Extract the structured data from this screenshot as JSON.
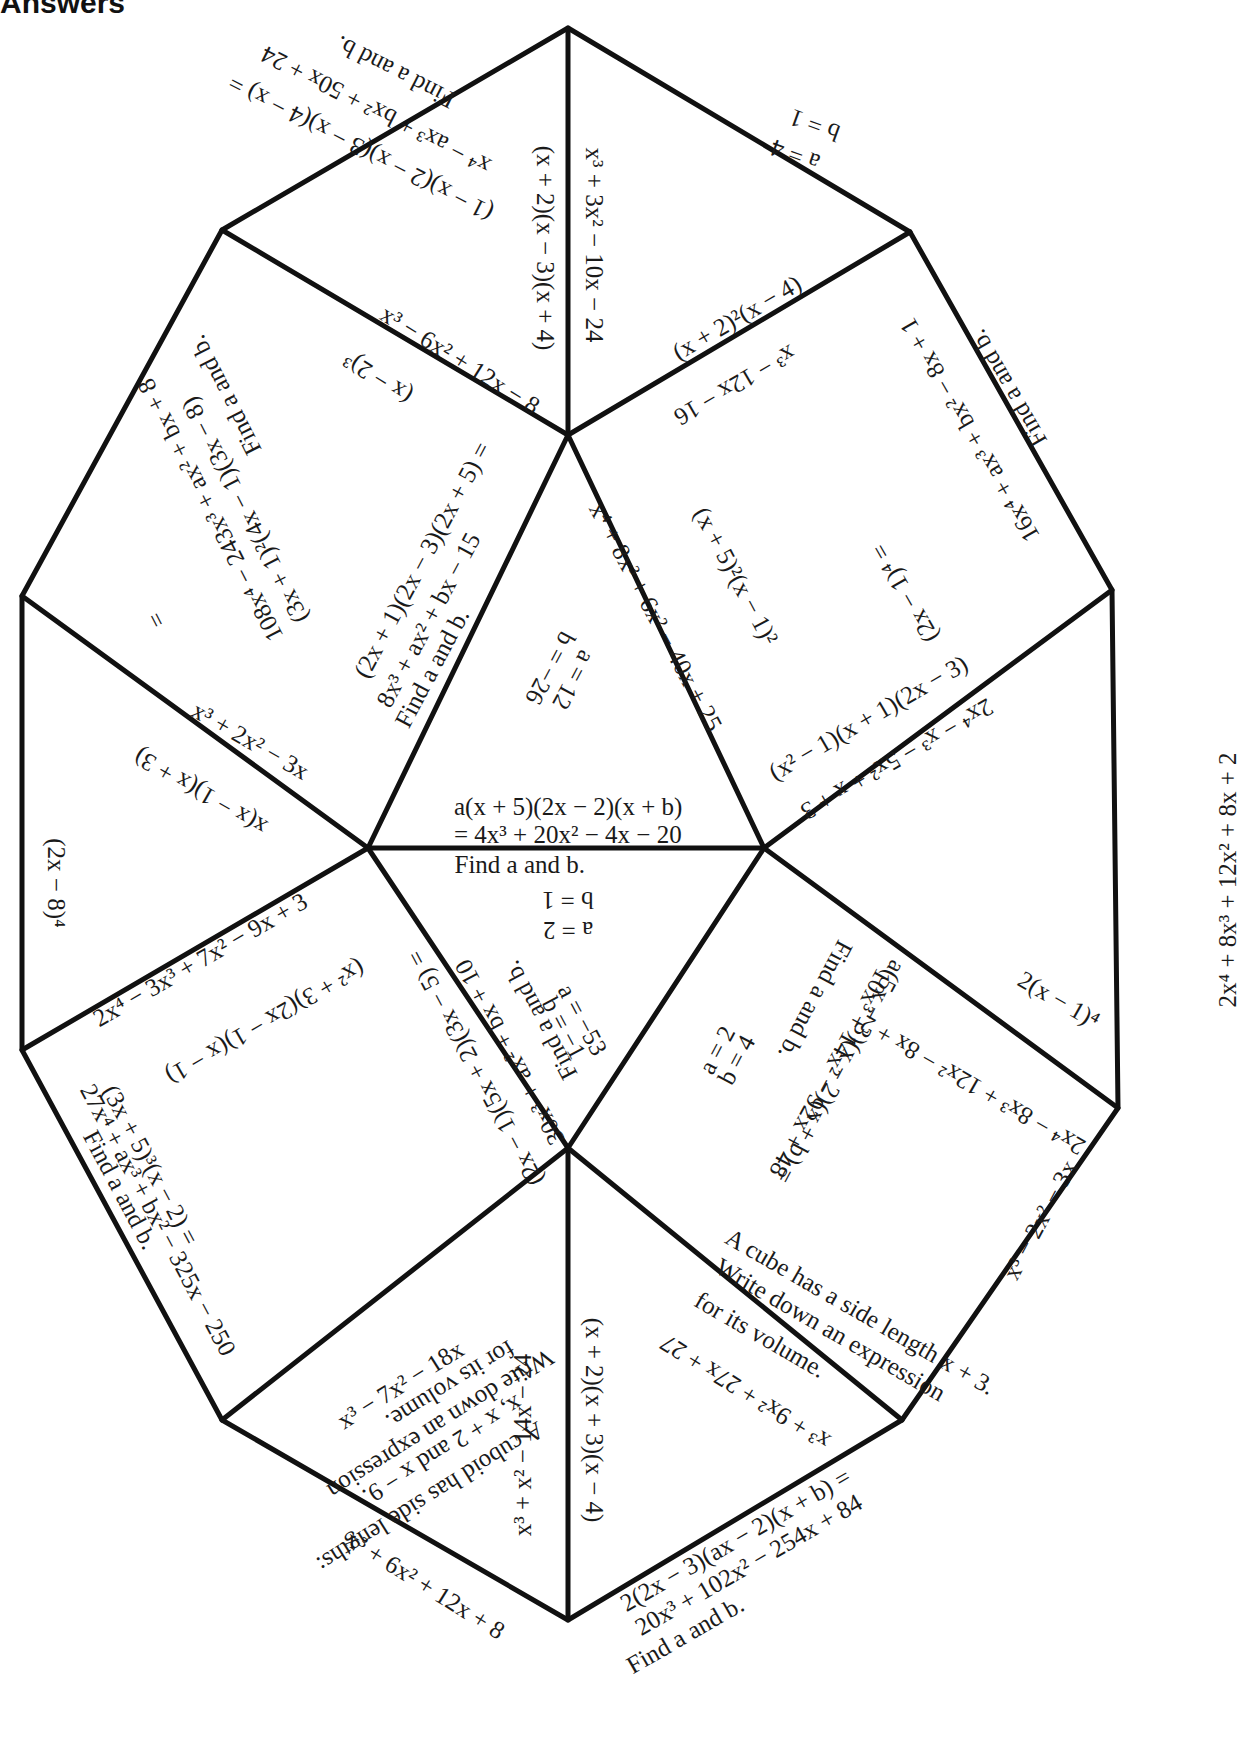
{
  "page": {
    "title": "Answers"
  },
  "colors": {
    "lines": "#111111",
    "text": "#1a1a1a",
    "background": "#ffffff"
  },
  "puzzle": {
    "type": "tarsia-triangle-puzzle",
    "vertices": {
      "top": [
        568,
        28
      ],
      "upper_left": [
        222,
        230
      ],
      "upper_right": [
        910,
        232
      ],
      "mid_left": [
        22,
        596
      ],
      "mid_right": [
        1112,
        590
      ],
      "lower_left": [
        22,
        1050
      ],
      "lower_right": [
        1118,
        1108
      ],
      "bottom_left": [
        222,
        1420
      ],
      "bottom_right": [
        902,
        1420
      ],
      "bottom": [
        568,
        1620
      ],
      "center_top": [
        568,
        435
      ],
      "center_left": [
        368,
        848
      ],
      "center_right": [
        764,
        848
      ],
      "center_bottom": [
        568,
        1148
      ]
    },
    "labels": [
      {
        "id": "t1",
        "text": "Find a and b.",
        "x": 395,
        "y": 72,
        "rot": 207
      },
      {
        "id": "t2",
        "text": "x⁴ − ax³ + bx² + 50x + 24",
        "x": 376,
        "y": 110,
        "rot": 207
      },
      {
        "id": "t3",
        "text": "(1 − x)(2 − x)(3 − x)(4 − x) =",
        "x": 360,
        "y": 148,
        "rot": 207
      },
      {
        "id": "t4",
        "text": "(x + 2)(x − 3)(x + 4)",
        "x": 545,
        "y": 248,
        "rot": 90
      },
      {
        "id": "t5",
        "text": "x³ + 3x² − 10x − 24",
        "x": 594,
        "y": 245,
        "rot": 90
      },
      {
        "id": "t6",
        "text": "a = 4",
        "x": 795,
        "y": 155,
        "rot": 200
      },
      {
        "id": "t7",
        "text": "b = 1",
        "x": 815,
        "y": 125,
        "rot": 200
      },
      {
        "id": "t8",
        "text": "(x + 2)²(x − 4)",
        "x": 737,
        "y": 318,
        "rot": -30
      },
      {
        "id": "t9",
        "text": "x³ − 12x − 16",
        "x": 735,
        "y": 385,
        "rot": 150
      },
      {
        "id": "t10",
        "text": "x³ − 6x² + 12x − 8",
        "x": 460,
        "y": 360,
        "rot": 32
      },
      {
        "id": "t11",
        "text": "(x − 2)³",
        "x": 378,
        "y": 378,
        "rot": 212
      },
      {
        "id": "t12",
        "text": "Find a and b.",
        "x": 225,
        "y": 395,
        "rot": 243
      },
      {
        "id": "t13",
        "text": "108x⁴ − 243x³ + ax² + bx + 8",
        "x": 210,
        "y": 510,
        "rot": 243
      },
      {
        "id": "t14",
        "text": "(3x + 1)²(4x − 1)(3x − 8)",
        "x": 245,
        "y": 510,
        "rot": 243
      },
      {
        "id": "t15",
        "text": "= ",
        "x": 155,
        "y": 617,
        "rot": 243
      },
      {
        "id": "t16",
        "text": "(2x + 1)(2x − 3)(2x + 5) =",
        "x": 422,
        "y": 560,
        "rot": -62
      },
      {
        "id": "t17",
        "text": "8x³ + ax² + bx − 15",
        "x": 428,
        "y": 620,
        "rot": -62
      },
      {
        "id": "t18",
        "text": "Find a and b.",
        "x": 432,
        "y": 668,
        "rot": -62
      },
      {
        "id": "t19",
        "text": "a = 12",
        "x": 573,
        "y": 680,
        "rot": 118
      },
      {
        "id": "t20",
        "text": "b = −26",
        "x": 550,
        "y": 668,
        "rot": 118
      },
      {
        "id": "t21",
        "text": "x⁴ + 8x³ + 6x² − 40x + 25",
        "x": 655,
        "y": 617,
        "rot": 62
      },
      {
        "id": "t22",
        "text": "(x + 5)²(x − 1)²",
        "x": 736,
        "y": 576,
        "rot": 62
      },
      {
        "id": "t23",
        "text": "a(x + 5)(2x − 2)(x + b)",
        "x": 568,
        "y": 807,
        "rot": 0
      },
      {
        "id": "t24",
        "text": "= 4x³ + 20x² − 4x − 20",
        "x": 568,
        "y": 835,
        "rot": 0
      },
      {
        "id": "t25",
        "text": "Find a and b.",
        "x": 520,
        "y": 865,
        "rot": 0
      },
      {
        "id": "t26",
        "text": "Find a and b.",
        "x": 1008,
        "y": 388,
        "rot": 240
      },
      {
        "id": "t27",
        "text": "16x⁴ + ax³ + bx² − 8x + 1",
        "x": 970,
        "y": 430,
        "rot": 240
      },
      {
        "id": "t28",
        "text": "(2x − 1)⁴ =",
        "x": 905,
        "y": 593,
        "rot": 240
      },
      {
        "id": "t29",
        "text": "(x² − 1)(x + 1)(2x − 3)",
        "x": 868,
        "y": 718,
        "rot": -30
      },
      {
        "id": "t30",
        "text": "2x⁴ − x³ − 5x² + x + 3",
        "x": 897,
        "y": 759,
        "rot": 150
      },
      {
        "id": "t31",
        "text": "2x⁴ + 8x³ + 12x² + 8x + 2",
        "x": 1227,
        "y": 880,
        "rot": -90
      },
      {
        "id": "t32",
        "text": "x³ + 2x² − 3x",
        "x": 250,
        "y": 741,
        "rot": 30
      },
      {
        "id": "t33",
        "text": "x(x − 1)(x + 3)",
        "x": 200,
        "y": 792,
        "rot": 210
      },
      {
        "id": "t34",
        "text": "(2x − 8)⁴",
        "x": 55,
        "y": 883,
        "rot": 90
      },
      {
        "id": "t35",
        "text": "2x⁴ − 3x³ + 7x² − 9x + 3",
        "x": 200,
        "y": 960,
        "rot": -30
      },
      {
        "id": "t36",
        "text": "a = 2",
        "x": 568,
        "y": 930,
        "rot": 180
      },
      {
        "id": "t37",
        "text": "b = 1",
        "x": 568,
        "y": 900,
        "rot": 180
      },
      {
        "id": "t38",
        "text": "(x² + 3)(2x − 1)(x − 1)",
        "x": 265,
        "y": 1022,
        "rot": 150
      },
      {
        "id": "t39",
        "text": "(2x − 1)(5x + 2)(3x − 5) =",
        "x": 475,
        "y": 1068,
        "rot": 242
      },
      {
        "id": "t40",
        "text": "30x³ + ax² + bx + 10",
        "x": 510,
        "y": 1052,
        "rot": 242
      },
      {
        "id": "t41",
        "text": "Find a and b.",
        "x": 540,
        "y": 1020,
        "rot": 242
      },
      {
        "id": "t42",
        "text": "a = −53",
        "x": 582,
        "y": 1020,
        "rot": 62
      },
      {
        "id": "t43",
        "text": "b = −1",
        "x": 564,
        "y": 1028,
        "rot": 62
      },
      {
        "id": "t44",
        "text": "a = 2",
        "x": 717,
        "y": 1050,
        "rot": -62
      },
      {
        "id": "t45",
        "text": "b = 4",
        "x": 737,
        "y": 1060,
        "rot": -62
      },
      {
        "id": "t46",
        "text": "Find a and b.",
        "x": 815,
        "y": 1000,
        "rot": 118
      },
      {
        "id": "t47",
        "text": "10x³ + 14x² − 92x + 48",
        "x": 830,
        "y": 1073,
        "rot": 118
      },
      {
        "id": "t48",
        "text": "a(5x − 3)(x − 2)(x + b) =",
        "x": 840,
        "y": 1072,
        "rot": 118
      },
      {
        "id": "t49",
        "text": "2(x − 1)⁴",
        "x": 1058,
        "y": 1000,
        "rot": 30
      },
      {
        "id": "t50",
        "text": "2x⁴ − 8x³ + 12x² − 8x + 2",
        "x": 972,
        "y": 1085,
        "rot": 210
      },
      {
        "id": "t51",
        "text": "(3x + 5)³(x − 2) =",
        "x": 150,
        "y": 1165,
        "rot": 62
      },
      {
        "id": "t52",
        "text": "27x⁴ + ax³ + bx² − 325x − 250",
        "x": 158,
        "y": 1220,
        "rot": 62
      },
      {
        "id": "t53",
        "text": "Find a and b.",
        "x": 120,
        "y": 1190,
        "rot": 62
      },
      {
        "id": "t54",
        "text": "x³ − 7x² − 18x",
        "x": 400,
        "y": 1385,
        "rot": -32
      },
      {
        "id": "t55",
        "text": "A cuboid has side lengths:",
        "x": 430,
        "y": 1497,
        "rot": 148
      },
      {
        "id": "t56",
        "text": "x, x + 2 and x − 9.",
        "x": 442,
        "y": 1450,
        "rot": 148
      },
      {
        "id": "t57",
        "text": "Write down an expression",
        "x": 440,
        "y": 1424,
        "rot": 148
      },
      {
        "id": "t58",
        "text": "for its volume.",
        "x": 450,
        "y": 1385,
        "rot": 148
      },
      {
        "id": "t59",
        "text": "x³ + x² − 14x − 24",
        "x": 523,
        "y": 1445,
        "rot": -90
      },
      {
        "id": "t60",
        "text": "x³ + 6x² + 12x + 8",
        "x": 425,
        "y": 1585,
        "rot": 32
      },
      {
        "id": "t61",
        "text": "(x + 2)(x + 3)(x − 4)",
        "x": 594,
        "y": 1420,
        "rot": 90
      },
      {
        "id": "t62",
        "text": "x³ + 9x² + 27x + 27",
        "x": 745,
        "y": 1392,
        "rot": 212
      },
      {
        "id": "t63",
        "text": "2(2x − 3)(ax − 2)(x + b) =",
        "x": 735,
        "y": 1540,
        "rot": -30
      },
      {
        "id": "t64",
        "text": "20x³ + 102x² − 254x + 84",
        "x": 748,
        "y": 1565,
        "rot": -30
      },
      {
        "id": "t65",
        "text": "Find a and b.",
        "x": 685,
        "y": 1635,
        "rot": -30
      },
      {
        "id": "t66",
        "text": "A cube has a side length x + 3.",
        "x": 860,
        "y": 1312,
        "rot": 30
      },
      {
        "id": "t67",
        "text": "Write down an expression",
        "x": 830,
        "y": 1330,
        "rot": 30
      },
      {
        "id": "t68",
        "text": "for its volume.",
        "x": 760,
        "y": 1335,
        "rot": 30
      },
      {
        "id": "t69",
        "text": "x³ − 2x² − 3x",
        "x": 1040,
        "y": 1220,
        "rot": -62
      }
    ]
  }
}
